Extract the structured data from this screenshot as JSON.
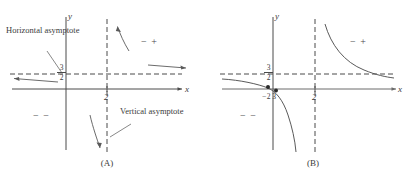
{
  "figure": {
    "title_hidden_top_text": "",
    "panels": [
      {
        "id": "A",
        "caption": "(A)",
        "axis_x_label": "x",
        "axis_y_label": "y",
        "horizontal_asymptote": {
          "label": "Horizontal asymptote",
          "value_numerator": "3",
          "value_denominator": "2",
          "value_text": "3/2",
          "style": "dashed"
        },
        "vertical_asymptote": {
          "label": "Vertical asymptote",
          "value_text": "2",
          "style": "dashed"
        },
        "x_tick": "2",
        "sign_regions": [
          {
            "name": "upper-right",
            "text": "− +"
          },
          {
            "name": "lower-left",
            "text": "− −"
          }
        ],
        "arrows": [
          {
            "name": "arrow-upper-right-horizontal",
            "direction": "right"
          },
          {
            "name": "arrow-left-along-asymptote",
            "direction": "left"
          },
          {
            "name": "arrow-up-right-branch",
            "direction": "up"
          },
          {
            "name": "arrow-down-left-of-vertical-asymptote",
            "direction": "down"
          }
        ]
      },
      {
        "id": "B",
        "caption": "(B)",
        "axis_x_label": "x",
        "axis_y_label": "y",
        "horizontal_asymptote": {
          "value_numerator": "3",
          "value_denominator": "2",
          "value_text": "3/2",
          "style": "dashed"
        },
        "vertical_asymptote": {
          "value_text": "2",
          "style": "dashed"
        },
        "x_tick": "2",
        "y_intercept_label": {
          "sign": "−",
          "numerator": "2",
          "denominator": "3",
          "value_text": "-2/3"
        },
        "sign_regions": [
          {
            "name": "upper-right",
            "text": "− +"
          },
          {
            "name": "lower-left",
            "text": "− −"
          }
        ],
        "points": [
          {
            "name": "x-intercept-dot"
          },
          {
            "name": "y-intercept-dot"
          }
        ]
      }
    ],
    "colors": {
      "ink": "#3b3b3b",
      "curve": "#555555",
      "axis": "#4a4a4a",
      "dashed": "#4a4a4a"
    }
  }
}
